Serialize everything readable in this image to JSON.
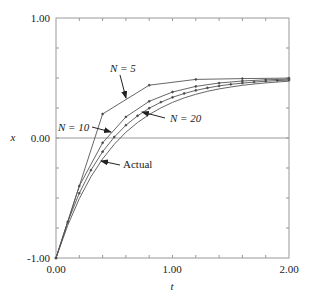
{
  "chart_data": {
    "type": "line",
    "title": "",
    "xlabel": "t",
    "ylabel": "x",
    "xlim": [
      0,
      2
    ],
    "ylim": [
      -1,
      1
    ],
    "x_ticks": [
      "0.00",
      "1.00",
      "2.00"
    ],
    "y_ticks": [
      "-1.00",
      "0.00",
      "1.00"
    ],
    "grid": false,
    "zero_line": true,
    "series": [
      {
        "name": "N = 5",
        "x": [
          0,
          0.4,
          0.8,
          1.2,
          1.6,
          2.0
        ],
        "values": [
          -1,
          0.2,
          0.44,
          0.488,
          0.4952,
          0.499
        ]
      },
      {
        "name": "N = 10",
        "x": [
          0,
          0.2,
          0.4,
          0.6,
          0.8,
          1.0,
          1.2,
          1.4,
          1.6,
          1.8,
          2.0
        ],
        "values": [
          -1,
          -0.4,
          -0.04,
          0.176,
          0.3056,
          0.3834,
          0.43,
          0.458,
          0.4748,
          0.4849,
          0.4909
        ]
      },
      {
        "name": "N = 20",
        "x": [
          0,
          0.1,
          0.2,
          0.3,
          0.4,
          0.5,
          0.6,
          0.7,
          0.8,
          0.9,
          1.0,
          1.1,
          1.2,
          1.3,
          1.4,
          1.5,
          1.6,
          1.7,
          1.8,
          1.9,
          2.0
        ],
        "values": [
          -1,
          -0.7,
          -0.46,
          -0.268,
          -0.1144,
          0.0085,
          0.1068,
          0.1854,
          0.2484,
          0.2987,
          0.339,
          0.3712,
          0.3969,
          0.4176,
          0.434,
          0.4472,
          0.4578,
          0.4662,
          0.473,
          0.4784,
          0.4827
        ]
      },
      {
        "name": "Actual",
        "x": [
          0,
          0.1,
          0.2,
          0.3,
          0.4,
          0.5,
          0.6,
          0.7,
          0.8,
          0.9,
          1.0,
          1.1,
          1.2,
          1.3,
          1.4,
          1.5,
          1.6,
          1.7,
          1.8,
          1.9,
          2.0
        ],
        "values": [
          -1,
          -0.728,
          -0.506,
          -0.323,
          -0.174,
          -0.052,
          0.048,
          0.129,
          0.196,
          0.251,
          0.297,
          0.334,
          0.364,
          0.389,
          0.409,
          0.425,
          0.439,
          0.45,
          0.459,
          0.467,
          0.473
        ]
      }
    ],
    "annotations": [
      {
        "text": "N = 5",
        "arrow_to": [
          0.55,
          0.31
        ]
      },
      {
        "text": "N = 10",
        "arrow_to": [
          0.5,
          0.07
        ]
      },
      {
        "text": "N = 20",
        "arrow_to": [
          0.73,
          0.2
        ]
      },
      {
        "text": "Actual",
        "arrow_to": [
          0.57,
          -0.08
        ]
      }
    ],
    "legend": "none (inline annotations)"
  },
  "labels": {
    "xlabel": "t",
    "ylabel": "x",
    "x_ticks": [
      "0.00",
      "1.00",
      "2.00"
    ],
    "y_ticks": [
      "1.00",
      "0.00",
      "-1.00"
    ],
    "ann_n5": "N = 5",
    "ann_n10": "N = 10",
    "ann_n20": "N = 20",
    "ann_actual": "Actual"
  }
}
